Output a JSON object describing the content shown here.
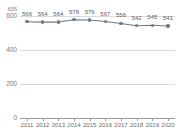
{
  "top_caption": " ",
  "chart_data": {
    "type": "line",
    "title": "",
    "subtitle": "",
    "xlabel": "",
    "ylabel": "",
    "categories": [
      "2011",
      "2012",
      "2013",
      "2014",
      "2015",
      "2016",
      "2017",
      "2018",
      "2019",
      "2020"
    ],
    "values": [
      566,
      564,
      564,
      578,
      576,
      567,
      556,
      542,
      545,
      541
    ],
    "data_labels": [
      "566",
      "564",
      "564",
      "578",
      "576",
      "567",
      "556",
      "542",
      "545",
      "541"
    ],
    "series": [
      {
        "name": "",
        "values": [
          566,
          564,
          564,
          578,
          576,
          567,
          556,
          542,
          545,
          541
        ],
        "color": "#6e7a86",
        "marker": "circle"
      }
    ],
    "ylim": [
      0,
      635
    ],
    "yticks": [
      0,
      200,
      400,
      600
    ],
    "ytick_labels": [
      "0",
      "200",
      "400",
      "600"
    ],
    "ytop_label": "635",
    "grid": true,
    "grid_color": "#d9d9d9",
    "legend": "none",
    "axis_color": "#9a9a9a",
    "label_color": "#5c5c5c",
    "line_color": "#6e7a86"
  }
}
